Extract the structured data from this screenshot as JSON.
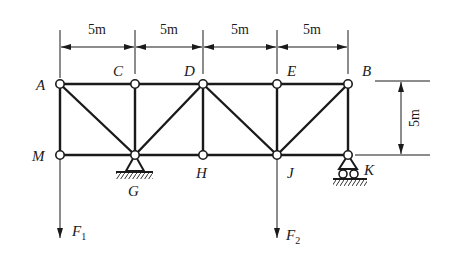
{
  "diagram": {
    "type": "plane-truss",
    "dimensions": {
      "panel_1": "5m",
      "panel_2": "5m",
      "panel_3": "5m",
      "panel_4": "5m",
      "height": "5m"
    },
    "nodes": {
      "A": "A",
      "C": "C",
      "D": "D",
      "E": "E",
      "B": "B",
      "M": "M",
      "G": "G",
      "H": "H",
      "J": "J",
      "K": "K"
    },
    "loads": {
      "F1": {
        "symbol": "F",
        "subscript": "1",
        "at": "M",
        "direction": "down"
      },
      "F2": {
        "symbol": "F",
        "subscript": "2",
        "at": "J",
        "direction": "down"
      }
    },
    "supports": {
      "G": "pin",
      "K": "roller"
    },
    "members": [
      [
        "A",
        "C"
      ],
      [
        "C",
        "D"
      ],
      [
        "D",
        "E"
      ],
      [
        "E",
        "B"
      ],
      [
        "M",
        "G"
      ],
      [
        "G",
        "H"
      ],
      [
        "H",
        "J"
      ],
      [
        "J",
        "K"
      ],
      [
        "A",
        "M"
      ],
      [
        "C",
        "G"
      ],
      [
        "D",
        "H"
      ],
      [
        "E",
        "J"
      ],
      [
        "B",
        "K"
      ],
      [
        "A",
        "G"
      ],
      [
        "D",
        "G"
      ],
      [
        "D",
        "J"
      ],
      [
        "B",
        "J"
      ]
    ]
  }
}
